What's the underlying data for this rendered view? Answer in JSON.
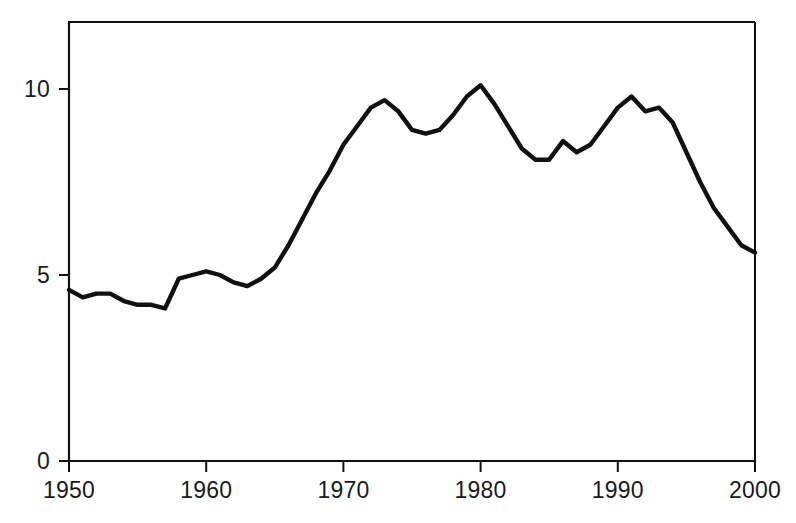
{
  "chart_data": {
    "type": "line",
    "title": "",
    "subtitle": "",
    "xlabel": "",
    "ylabel": "",
    "xlim": [
      1950,
      2000
    ],
    "ylim": [
      0,
      12
    ],
    "grid": false,
    "legend": null,
    "legend_position": "none",
    "series_color": "#111111",
    "background_color": "#ffffff",
    "axis_color": "#111111",
    "frame": "box",
    "x_ticks": [
      1950,
      1960,
      1970,
      1980,
      1990,
      2000
    ],
    "x_tick_labels": [
      "1950",
      "1960",
      "1970",
      "1980",
      "1990",
      "2000"
    ],
    "y_ticks": [
      0,
      5,
      10
    ],
    "y_tick_labels": [
      "0",
      "5",
      "10"
    ],
    "x": [
      1950,
      1951,
      1952,
      1953,
      1954,
      1955,
      1956,
      1957,
      1958,
      1959,
      1960,
      1961,
      1962,
      1963,
      1964,
      1965,
      1966,
      1967,
      1968,
      1969,
      1970,
      1971,
      1972,
      1973,
      1974,
      1975,
      1976,
      1977,
      1978,
      1979,
      1980,
      1981,
      1982,
      1983,
      1984,
      1985,
      1986,
      1987,
      1988,
      1989,
      1990,
      1991,
      1992,
      1993,
      1994,
      1995,
      1996,
      1997,
      1998,
      1999,
      2000
    ],
    "series": [
      {
        "name": "series-1",
        "color": "#111111",
        "values": [
          4.6,
          4.4,
          4.5,
          4.5,
          4.3,
          4.2,
          4.2,
          4.1,
          4.9,
          5.0,
          5.1,
          5.0,
          4.8,
          4.7,
          4.9,
          5.2,
          5.8,
          6.5,
          7.2,
          7.8,
          8.5,
          9.0,
          9.5,
          9.7,
          9.4,
          8.9,
          8.8,
          8.9,
          9.3,
          9.8,
          10.1,
          9.6,
          9.0,
          8.4,
          8.1,
          8.1,
          8.6,
          8.3,
          8.5,
          9.0,
          9.5,
          9.8,
          9.4,
          9.5,
          9.1,
          8.3,
          7.5,
          6.8,
          6.3,
          5.8,
          5.6
        ]
      }
    ]
  },
  "geometry": {
    "plot_left": 69,
    "plot_right": 755,
    "plot_top": 22,
    "plot_bottom": 461,
    "y_zero_px": 461,
    "y_unit_px": 37.2
  }
}
